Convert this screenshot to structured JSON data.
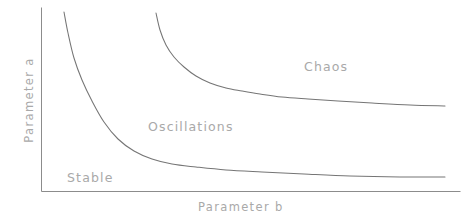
{
  "figure": {
    "background_color": "#ffffff",
    "width": 467,
    "height": 221
  },
  "axes": {
    "color": "#8c8c8c",
    "line_width": 1,
    "x_axis_label": "Parameter b",
    "y_axis_label": "Parameter a",
    "origin_px": [
      41,
      192
    ],
    "x_end_px": [
      460,
      192
    ],
    "y_top_px": [
      41,
      8
    ]
  },
  "regions": [
    {
      "name": "stable",
      "label": "Stable",
      "color": "#a9a9a9"
    },
    {
      "name": "oscillations",
      "label": "Oscillations",
      "color": "#a9a9a9"
    },
    {
      "name": "chaos",
      "label": "Chaos",
      "color": "#a9a9a9"
    }
  ],
  "chart_data": {
    "type": "line",
    "title": "",
    "xlabel": "Parameter b",
    "ylabel": "Parameter a",
    "grid": false,
    "legend_position": "none",
    "annotations": [
      {
        "text": "Stable",
        "x_px": 67,
        "y_px": 178
      },
      {
        "text": "Oscillations",
        "x_px": 148,
        "y_px": 127
      },
      {
        "text": "Chaos",
        "x_px": 304,
        "y_px": 67
      }
    ],
    "axis_ranges": {
      "x_px": [
        41,
        460
      ],
      "y_px": [
        192,
        8
      ]
    },
    "series": [
      {
        "name": "stable-oscillations boundary",
        "color": "#757575",
        "points_px": [
          [
            64,
            12
          ],
          [
            68,
            33
          ],
          [
            74,
            58
          ],
          [
            82,
            80
          ],
          [
            92,
            101
          ],
          [
            104,
            122
          ],
          [
            118,
            139
          ],
          [
            134,
            151
          ],
          [
            152,
            159
          ],
          [
            172,
            164
          ],
          [
            196,
            167
          ],
          [
            226,
            170
          ],
          [
            262,
            172
          ],
          [
            304,
            174
          ],
          [
            350,
            176
          ],
          [
            400,
            177
          ],
          [
            445,
            177
          ]
        ]
      },
      {
        "name": "oscillations-chaos boundary",
        "color": "#757575",
        "points_px": [
          [
            156,
            13
          ],
          [
            160,
            30
          ],
          [
            166,
            45
          ],
          [
            174,
            57
          ],
          [
            184,
            67
          ],
          [
            196,
            76
          ],
          [
            210,
            83
          ],
          [
            226,
            88
          ],
          [
            242,
            91
          ],
          [
            260,
            94
          ],
          [
            282,
            97
          ],
          [
            308,
            99
          ],
          [
            338,
            101
          ],
          [
            372,
            103
          ],
          [
            410,
            105
          ],
          [
            445,
            106
          ]
        ]
      }
    ]
  }
}
